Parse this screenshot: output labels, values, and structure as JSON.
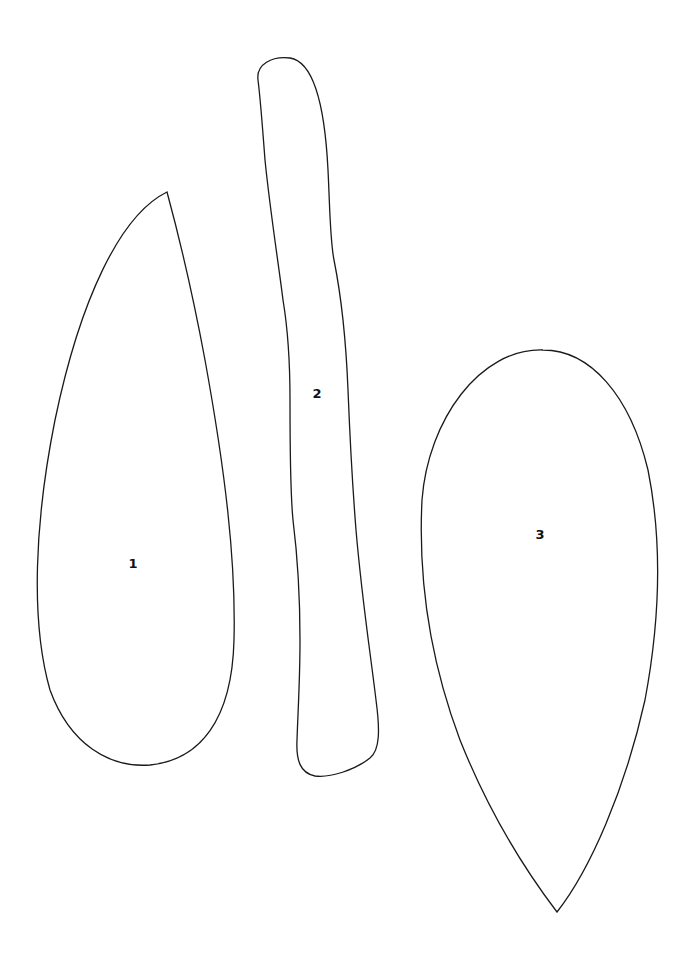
{
  "diagram": {
    "background": "#ffffff",
    "stroke_color": "#1a1a1a",
    "shapes": [
      {
        "id": "1",
        "label": "1",
        "description": "teardrop shape pointed at top",
        "label_pos": {
          "x": 133,
          "y": 563
        },
        "path": "M 167 192 C 120 215, 80 300, 55 420 C 35 520, 30 620, 50 690 C 70 745, 110 768, 150 765 C 200 760, 232 720, 234 640 C 236 560, 225 470, 205 360 C 192 290, 180 240, 167 192 Z"
      },
      {
        "id": "2",
        "label": "2",
        "description": "long narrow strip",
        "label_pos": {
          "x": 317,
          "y": 393
        },
        "path": "M 258 80 C 256 64, 272 56, 290 58 C 315 62, 325 110, 328 170 C 330 210, 330 240, 334 260 C 342 300, 346 340, 348 390 C 350 440, 352 480, 356 530 C 362 600, 370 650, 376 700 C 380 730, 380 750, 370 758 C 355 770, 330 778, 315 776 C 300 773, 296 760, 297 740 C 298 710, 300 680, 300 640 C 300 600, 298 560, 293 520 C 290 490, 290 450, 290 400 C 290 360, 288 330, 283 300 C 278 260, 270 210, 265 160 C 262 120, 260 95, 258 80 Z"
      },
      {
        "id": "3",
        "label": "3",
        "description": "egg/teardrop shape pointed at bottom",
        "label_pos": {
          "x": 540,
          "y": 534
        },
        "path": "M 543 350 C 480 348, 428 420, 422 500 C 418 580, 430 660, 460 740 C 490 815, 525 870, 557 912 C 590 870, 625 790, 645 700 C 660 620, 662 540, 648 470 C 630 395, 590 350, 543 350 Z"
      }
    ]
  }
}
